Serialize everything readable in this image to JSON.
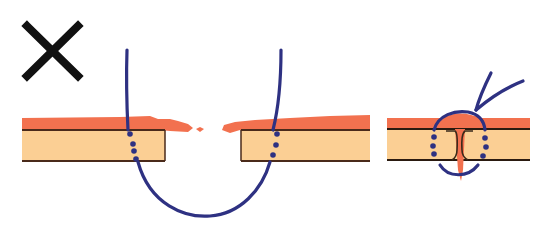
{
  "diagram": {
    "title": "Incorrect suture technique illustration",
    "marker": {
      "symbol": "✕",
      "meaning": "incorrect",
      "color": "#111111"
    },
    "colors": {
      "epidermis": "#f2714f",
      "dermis": "#fbcf94",
      "outline": "#4a2a1a",
      "suture": "#2e3182",
      "background": "#ffffff"
    },
    "panels": [
      {
        "id": "open-wound",
        "description": "Wide suture bite through separated skin edges, loop passes beneath the wound gap"
      },
      {
        "id": "closed-wound",
        "description": "Tied suture with inverted/mismatched wound edges and knot above skin"
      }
    ]
  }
}
